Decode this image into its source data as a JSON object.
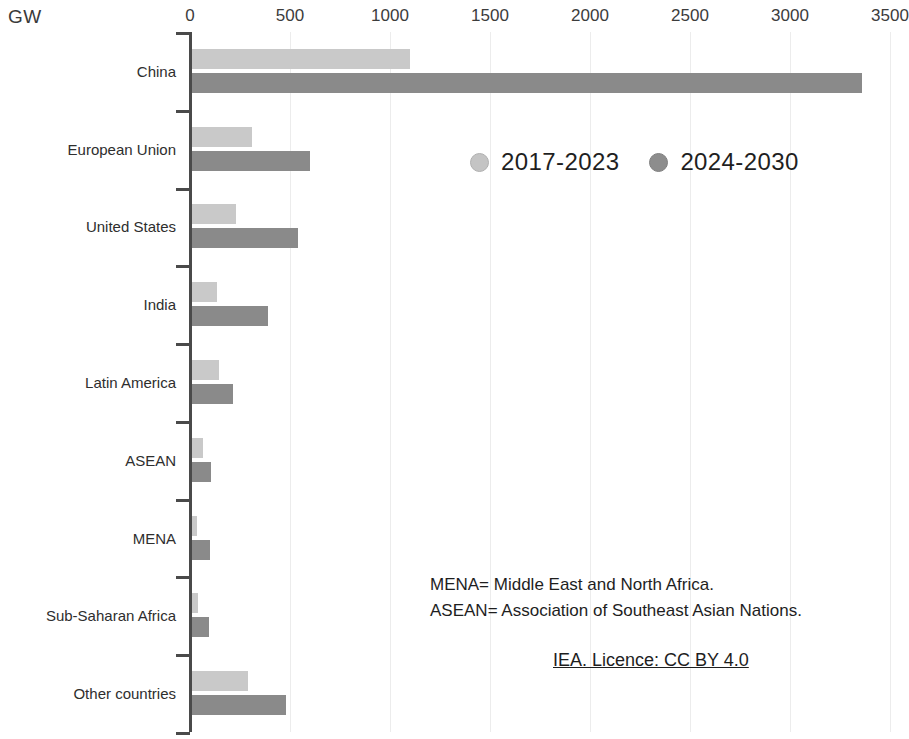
{
  "chart_data": {
    "type": "bar",
    "orientation": "horizontal",
    "title": "",
    "subtitle": "",
    "xlabel": "",
    "ylabel": "GW",
    "unit_label": "GW",
    "xlim": [
      0,
      3500
    ],
    "xticks": [
      0,
      500,
      1000,
      1500,
      2000,
      2500,
      3000,
      3500
    ],
    "xtick_labels": [
      "0",
      "500",
      "1000",
      "1500",
      "2000",
      "2500",
      "3000",
      "3500"
    ],
    "grid": true,
    "grid_axis": "x",
    "legend_position": "inside-upper-right",
    "categories": [
      "China",
      "European Union",
      "United States",
      "India",
      "Latin America",
      "ASEAN",
      "MENA",
      "Sub-Saharan Africa",
      "Other countries"
    ],
    "series": [
      {
        "name": "2017-2023",
        "color": "#c9c9c9",
        "values": [
          1090,
          300,
          220,
          125,
          135,
          55,
          25,
          30,
          280
        ]
      },
      {
        "name": "2024-2030",
        "color": "#8a8a8a",
        "values": [
          3350,
          590,
          530,
          380,
          205,
          95,
          90,
          85,
          470
        ]
      }
    ],
    "annotations": [
      "MENA= Middle East and North Africa.",
      "ASEAN= Association of Southeast Asian Nations."
    ],
    "licence": "IEA. Licence: CC BY 4.0"
  },
  "colors": {
    "series_light": "#c9c9c9",
    "series_dark": "#8a8a8a",
    "axis": "#4a4a4a",
    "grid": "#ececec",
    "text": "#1e1e1e",
    "background": "#ffffff"
  }
}
